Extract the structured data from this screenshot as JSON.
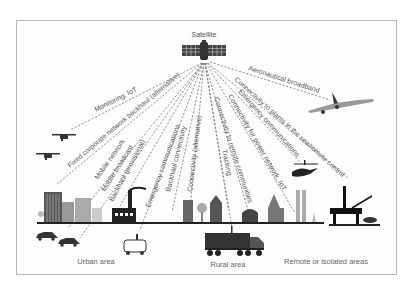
{
  "diagram": {
    "type": "satellite-use-cases",
    "hub": {
      "label": "Satellite",
      "icon": "satellite-icon"
    },
    "links": [
      {
        "label": "Monitoring, IoT",
        "target": "drones"
      },
      {
        "label": "Fixed corporate network backhaul (alternative)",
        "target": "urban-buildings"
      },
      {
        "label": "Mobile network",
        "target": "urban-cars"
      },
      {
        "label": "Mobile broadcast",
        "target": "urban-cars"
      },
      {
        "label": "Backhaul (provisional)",
        "target": "factory"
      },
      {
        "label": "Emergency communications",
        "target": "ambulance"
      },
      {
        "label": "Backhaul connectivity",
        "target": "rural-towers"
      },
      {
        "label": "Connectivity (alternative)",
        "target": "rural-houses"
      },
      {
        "label": "Connectivity to remote communities",
        "target": "rural-barn"
      },
      {
        "label": "Tracking",
        "target": "truck"
      },
      {
        "label": "Connectivity for power network, IoT",
        "target": "power-plant"
      },
      {
        "label": "Emergency communications",
        "target": "helicopter"
      },
      {
        "label": "Connectivity to plants in the sea/remote control",
        "target": "oil-rig"
      },
      {
        "label": "Aeronautical broadband",
        "target": "airplane"
      }
    ],
    "areas": [
      {
        "label": "Urban area"
      },
      {
        "label": "Rural area"
      },
      {
        "label": "Remote or isolated areas"
      }
    ],
    "colors": {
      "line": "#777777",
      "ink": "#333333",
      "frame": "#b8b8b8",
      "ground": "#222222"
    }
  }
}
